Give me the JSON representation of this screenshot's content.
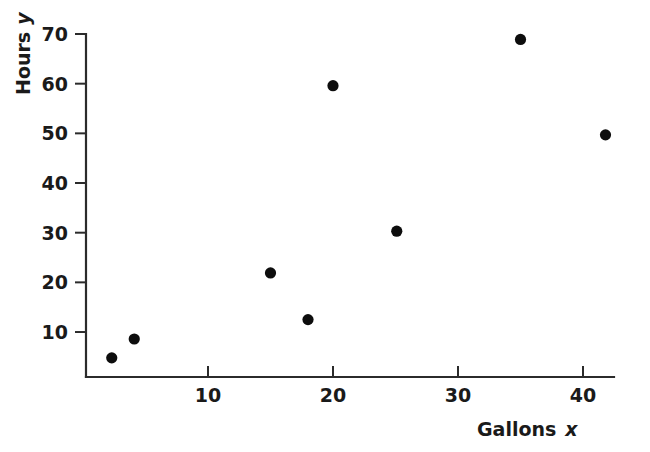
{
  "chart_data": {
    "type": "scatter",
    "title": "",
    "xlabel": "Gallons x",
    "ylabel": "Hours y",
    "xlabel_text": "Gallons",
    "xlabel_var": "x",
    "ylabel_text": "Hours",
    "ylabel_var": "y",
    "xlim": [
      0,
      42.5
    ],
    "ylim": [
      0,
      72
    ],
    "xticks": [
      10,
      20,
      30,
      40
    ],
    "yticks": [
      10,
      20,
      30,
      40,
      50,
      60,
      70
    ],
    "xticklabels": [
      "10",
      "20",
      "30",
      "40"
    ],
    "yticklabels": [
      "10",
      "20",
      "30",
      "40",
      "50",
      "60",
      "70"
    ],
    "grid": false,
    "legend": null,
    "marker": "filled-circle",
    "marker_color": "#0d0d0d",
    "points": [
      {
        "x": 2.3,
        "y": 4.8
      },
      {
        "x": 4.1,
        "y": 8.6
      },
      {
        "x": 15.0,
        "y": 21.9
      },
      {
        "x": 18.0,
        "y": 12.5
      },
      {
        "x": 20.0,
        "y": 59.6
      },
      {
        "x": 25.1,
        "y": 30.3
      },
      {
        "x": 35.0,
        "y": 68.9
      },
      {
        "x": 41.8,
        "y": 49.7
      }
    ]
  }
}
